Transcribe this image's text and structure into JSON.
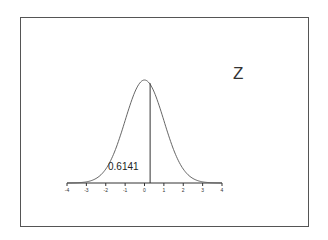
{
  "chart_data": {
    "type": "line",
    "title": "Z",
    "xlabel": "",
    "ylabel": "",
    "x_ticks": [
      "-4",
      "-3",
      "-2",
      "-1",
      "0",
      "1",
      "2",
      "3",
      "4"
    ],
    "xlim": [
      -4,
      4
    ],
    "grid": false,
    "series": [
      {
        "name": "standard normal density",
        "distribution": "N(0,1)"
      }
    ],
    "annotations": [
      {
        "text": "0.6141",
        "description": "area to the left of the vertical line",
        "z_value": 0.29
      }
    ],
    "vertical_line_at": 0.29
  },
  "labels": {
    "title": "Z",
    "area_value": "0.6141"
  }
}
